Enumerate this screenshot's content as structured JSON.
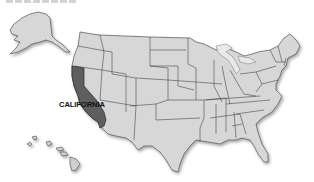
{
  "map": {
    "type": "US states locator map",
    "highlighted_state": "California",
    "label": "CALIFORNIA",
    "colors": {
      "state_fill": "#d7d7d7",
      "highlight_fill": "#5e5e5e",
      "border": "#3a3a3a",
      "background": "#ffffff"
    },
    "insets": [
      "Alaska",
      "Hawaii"
    ]
  }
}
